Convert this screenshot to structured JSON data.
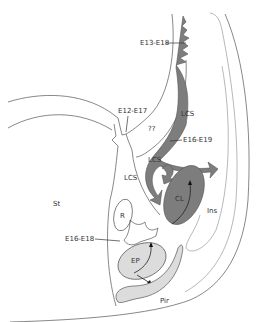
{
  "diagram": {
    "type": "anatomical-schematic",
    "labels": {
      "e13_e18": "E13-E18",
      "e12_e17": "E12-E17",
      "unknown": "??",
      "lcs_upper": "LCS",
      "e16_e19": "E16-E19",
      "lcs_middle": "LCS",
      "lcs_left": "LCS",
      "st": "St",
      "r": "R",
      "cl": "CL",
      "ins": "Ins",
      "e16_e18": "E16-E18",
      "ep": "EP",
      "pir": "Pir"
    },
    "colors": {
      "dark_region": "#7d7d7d",
      "light_region": "#dcdcdc",
      "outline": "#555555",
      "background": "#ffffff"
    }
  }
}
